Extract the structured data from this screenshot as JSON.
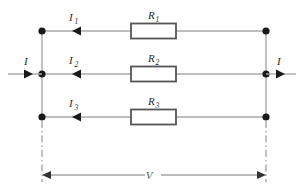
{
  "figure": {
    "name": "parallel-resistor-circuit",
    "background_color": "#ffffff",
    "wire_color": "#a9a9a9",
    "node_color": "#1a1a1a",
    "resistor_border_color": "#555555",
    "dimension_color": "#777777"
  },
  "branches": [
    {
      "current_label": "I",
      "current_subscript": "1",
      "resistor_label": "R",
      "resistor_subscript": "1"
    },
    {
      "current_label": "I",
      "current_subscript": "2",
      "resistor_label": "R",
      "resistor_subscript": "2"
    },
    {
      "current_label": "I",
      "current_subscript": "3",
      "resistor_label": "R",
      "resistor_subscript": "3"
    }
  ],
  "terminals": {
    "input_current_label": "I",
    "output_current_label": "I"
  },
  "dimension": {
    "voltage_label": "V"
  }
}
